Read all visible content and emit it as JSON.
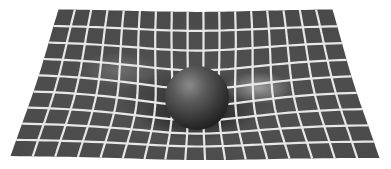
{
  "image": {
    "description": "Spacetime curvature illustration: a dark sphere resting on a warped grid sheet",
    "width": 391,
    "height": 169,
    "background": "#ffffff"
  },
  "sheet": {
    "corners": {
      "top_left": [
        58,
        9
      ],
      "top_right": [
        333,
        9
      ],
      "bottom_right": [
        380,
        158
      ],
      "bottom_left": [
        10,
        156
      ]
    },
    "columns": 17,
    "rows": 9,
    "fill_color": "#4a4a4a",
    "line_color": "#e8e8e8",
    "highlight_color": "#9a9a9a"
  },
  "sphere": {
    "center": [
      197,
      98
    ],
    "radius": 32,
    "color": "#3a3a3a",
    "highlight": "#8a8a8a"
  },
  "well": {
    "center": [
      197,
      100
    ],
    "strength": 14,
    "radius": 70
  }
}
